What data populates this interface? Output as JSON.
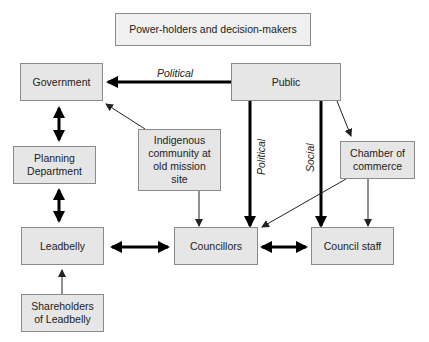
{
  "title": "Power-holders and decision-makers",
  "nodes": {
    "government": "Government",
    "public": "Public",
    "planning": "Planning Department",
    "indigenous": "Indigenous community at old mission site",
    "chamber": "Chamber of commerce",
    "leadbelly": "Leadbelly",
    "councillors": "Councillors",
    "council_staff": "Council staff",
    "shareholders": "Shareholders of Leadbelly"
  },
  "edge_labels": {
    "public_to_government": "Political",
    "public_to_councillors": "Political",
    "public_to_council_staff": "Social"
  },
  "colors": {
    "box_fill": "#e6e6e6",
    "box_border": "#8a8a8a",
    "arrow": "#000000"
  }
}
